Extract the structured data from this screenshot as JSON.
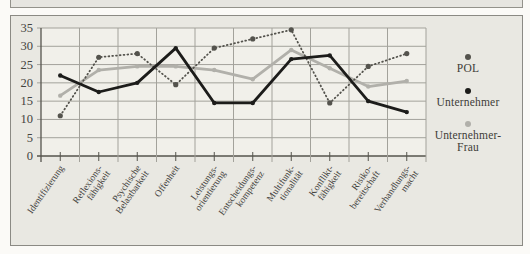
{
  "legend": {
    "items": [
      {
        "label": "POL",
        "display": "POL"
      },
      {
        "label": "Unternehmer",
        "display": "Unternehmer"
      },
      {
        "label": "Unternehmer-Frau",
        "display": "Unternehmer-\nFrau"
      }
    ]
  },
  "chart_data": {
    "type": "line",
    "categories": [
      "Identifizierung",
      "Reflexions-\nfähigkeit",
      "Psychische\nBelastbarkeit",
      "Offenheit",
      "Leistungs-\norientierung",
      "Entscheidungs-\nkompetenz",
      "Multifunk-\ntionalität",
      "Konflikt-\nfähigkeit",
      "Risiko-\nbereitschaft",
      "Verhandlungs-\nmacht"
    ],
    "series": [
      {
        "name": "POL",
        "style": "dotted",
        "color": "#54534d",
        "values": [
          11,
          27,
          28,
          19.5,
          29.5,
          32,
          34.5,
          14.5,
          24.5,
          28
        ]
      },
      {
        "name": "Unternehmer",
        "style": "solid",
        "color": "#1c1c1a",
        "values": [
          22,
          17.5,
          20,
          29.5,
          14.5,
          14.5,
          26.5,
          27.5,
          15,
          12
        ]
      },
      {
        "name": "Unternehmer-Frau",
        "style": "solid",
        "color": "#b1b0aa",
        "values": [
          16.5,
          23.5,
          24.5,
          24.5,
          23.5,
          21,
          29,
          24,
          19,
          20.5
        ]
      }
    ],
    "yticks": [
      35,
      30,
      25,
      20,
      15,
      10,
      5,
      0
    ],
    "ylim": [
      0,
      35
    ],
    "grid": true,
    "legend_position": "right",
    "title": "",
    "xlabel": "",
    "ylabel": ""
  },
  "colors": {
    "figure_background": "#e9e8e2",
    "plot_background": "#f1f0ea",
    "gridline": "#a3a29b",
    "axis": "#55544d",
    "text": "#44433e"
  }
}
